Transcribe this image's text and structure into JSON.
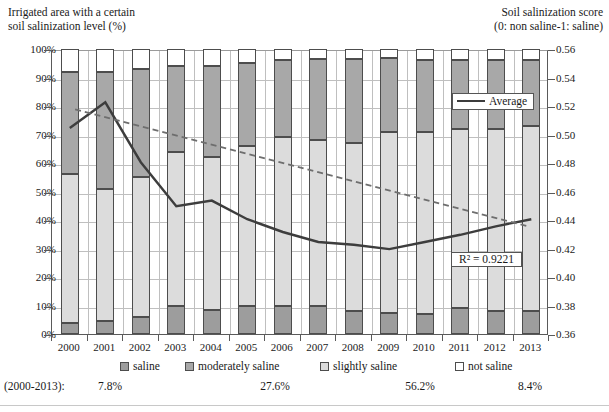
{
  "titles": {
    "left_line1": "Irrigated area with a certain",
    "left_line2": "soil salinization level (%)",
    "right_line1": "Soil salinization score",
    "right_line2": "(0: non saline-1: saline)"
  },
  "legend": {
    "average_label": "Average",
    "r2_label": "R² = 0.9221",
    "items": [
      {
        "key": "saline",
        "label": "saline",
        "color": "#9d9d9d"
      },
      {
        "key": "moderately_saline",
        "label": "moderately saline",
        "color": "#a8a8a8"
      },
      {
        "key": "slightly_saline",
        "label": "slightly saline",
        "color": "#dcdcdc"
      },
      {
        "key": "not_saline",
        "label": "not saline",
        "color": "#ffffff"
      }
    ]
  },
  "averages": {
    "row_label": "(2000-2013):",
    "values": [
      "7.8%",
      "27.6%",
      "56.2%",
      "8.4%"
    ]
  },
  "chart_data": {
    "type": "bar",
    "subtitle": "Soil salinization score (0: non saline-1: saline)",
    "xlabel": "",
    "ylabel": "Irrigated area with a certain soil salinization level (%)",
    "y2label": "Soil salinization score (0: non saline-1: saline)",
    "grid": true,
    "legend_position": "bottom",
    "categories": [
      "2000",
      "2001",
      "2002",
      "2003",
      "2004",
      "2005",
      "2006",
      "2007",
      "2008",
      "2009",
      "2010",
      "2011",
      "2012",
      "2013"
    ],
    "ylim": [
      0,
      100
    ],
    "yticks": [
      "0%",
      "10%",
      "20%",
      "30%",
      "40%",
      "50%",
      "60%",
      "70%",
      "80%",
      "90%",
      "100%"
    ],
    "y2lim": [
      0.36,
      0.56
    ],
    "y2ticks": [
      "0.36",
      "0.38",
      "0.40",
      "0.42",
      "0.44",
      "0.46",
      "0.48",
      "0.50",
      "0.52",
      "0.54",
      "0.56"
    ],
    "series": [
      {
        "name": "saline",
        "stack": true,
        "values": [
          4.0,
          4.5,
          6.0,
          10.0,
          8.5,
          10.0,
          10.0,
          10.0,
          8.0,
          7.5,
          7.0,
          9.0,
          8.0,
          8.0
        ]
      },
      {
        "name": "slightly saline",
        "stack": true,
        "values": [
          52.0,
          46.5,
          49.0,
          54.0,
          53.5,
          56.0,
          59.0,
          58.0,
          59.0,
          63.5,
          64.0,
          63.0,
          64.0,
          65.0
        ]
      },
      {
        "name": "moderately saline",
        "stack": true,
        "values": [
          36.0,
          41.0,
          38.0,
          30.0,
          32.0,
          29.0,
          27.0,
          28.5,
          29.5,
          26.0,
          25.0,
          24.0,
          24.0,
          23.0
        ]
      },
      {
        "name": "not saline",
        "stack": true,
        "values": [
          8.0,
          8.0,
          7.0,
          6.0,
          6.0,
          5.0,
          4.0,
          3.5,
          3.5,
          3.0,
          4.0,
          4.0,
          4.0,
          4.0
        ]
      }
    ],
    "average_line": {
      "name": "Average",
      "axis": "y2",
      "values": [
        0.506,
        0.524,
        0.482,
        0.451,
        0.455,
        0.442,
        0.433,
        0.426,
        0.424,
        0.421,
        0.426,
        0.431,
        0.437,
        0.442
      ]
    },
    "trendline": {
      "name": "Linear trend",
      "axis": "y2",
      "r_squared": 0.9221,
      "style": "dashed",
      "start_value": 0.519,
      "end_value": 0.437
    },
    "period_averages": {
      "saline": "7.8%",
      "moderately saline": "27.6%",
      "slightly saline": "56.2%",
      "not saline": "8.4%"
    }
  }
}
